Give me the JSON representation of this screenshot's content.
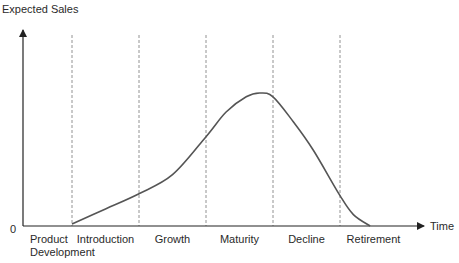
{
  "chart_data": {
    "type": "line",
    "title": "",
    "ylabel": "Expected Sales",
    "xlabel": "Time",
    "y_origin_label": "0",
    "stages": [
      "Product\nDevelopment",
      "Introduction",
      "Growth",
      "Maturity",
      "Decline",
      "Retirement"
    ],
    "stage_labels": [
      {
        "lines": [
          "Product",
          "Development"
        ]
      },
      {
        "lines": [
          "Introduction"
        ]
      },
      {
        "lines": [
          "Growth"
        ]
      },
      {
        "lines": [
          "Maturity"
        ]
      },
      {
        "lines": [
          "Decline"
        ]
      },
      {
        "lines": [
          "Retirement"
        ]
      }
    ],
    "xlim": [
      0,
      6
    ],
    "ylim": [
      0,
      1
    ],
    "stage_boundaries": [
      1,
      2,
      3,
      4,
      5
    ],
    "series": [
      {
        "name": "Expected Sales",
        "x": [
          1.0,
          1.5,
          2.0,
          2.5,
          3.0,
          3.3,
          3.6,
          3.8,
          4.0,
          4.3,
          4.6,
          5.0,
          5.2,
          5.45
        ],
        "y": [
          0.01,
          0.09,
          0.17,
          0.27,
          0.47,
          0.6,
          0.68,
          0.7,
          0.68,
          0.55,
          0.4,
          0.16,
          0.06,
          0.0
        ]
      }
    ],
    "grid": false,
    "legend": "none",
    "colors": {
      "curve": "#555555",
      "axis": "#222222",
      "divider": "#777777"
    }
  }
}
